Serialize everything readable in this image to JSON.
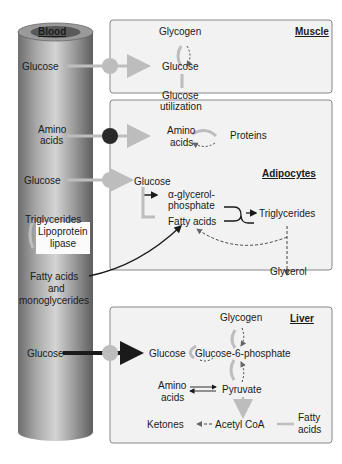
{
  "vessel": {
    "title": "Blood",
    "labels": {
      "glucose1": "Glucose",
      "amino1": "Amino",
      "amino2": "acids",
      "glucose2": "Glucose",
      "triglycerides": "Triglycerides",
      "lipase1": "Lipoprotein",
      "lipase2": "lipase",
      "fa1": "Fatty acids",
      "fa2": "and",
      "fa3": "monoglycerides",
      "glucose3": "Glucose"
    }
  },
  "muscle": {
    "title": "Muscle",
    "glycogen": "Glycogen",
    "glucose": "Glucose",
    "util1": "Glucose",
    "util2": "utilization",
    "amino1": "Amino",
    "amino2": "acids",
    "proteins": "Proteins"
  },
  "adipocytes": {
    "title": "Adipocytes",
    "glucose": "Glucose",
    "agp1": "α-glycerol-",
    "agp2": "phosphate",
    "fatty_acids": "Fatty acids",
    "triglycerides": "Triglycerides",
    "glycerol": "Glycerol"
  },
  "liver": {
    "title": "Liver",
    "glycogen": "Glycogen",
    "glucose": "Glucose",
    "g6p": "Glucose-6-phosphate",
    "amino1": "Amino",
    "amino2": "acids",
    "pyruvate": "Pyruvate",
    "ketones": "Ketones",
    "acetyl": "Acetyl CoA",
    "fatty1": "Fatty",
    "fatty2": "acids"
  },
  "colors": {
    "panel_bg": "#f2f2f2",
    "panel_border": "#888888",
    "gray_arrow": "#bdbdbd",
    "dark": "#1a1a1a"
  }
}
